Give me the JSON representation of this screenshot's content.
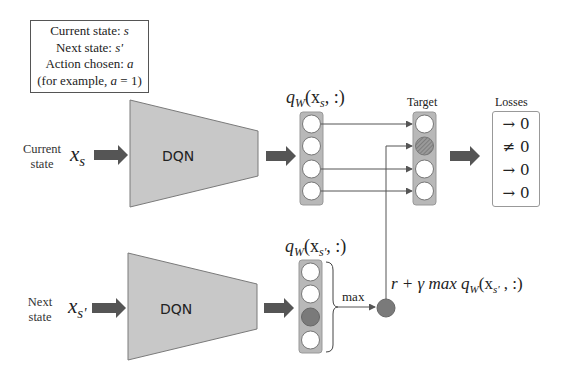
{
  "info_box": {
    "line1_label": "Current state: ",
    "line1_var": "s",
    "line2_label": "Next state: ",
    "line2_var": "s'",
    "line3_label": "Action chosen: ",
    "line3_var": "a",
    "line4_prefix": "(for example, ",
    "line4_var": "a",
    "line4_suffix": " = 1)"
  },
  "top_branch": {
    "side_label_line1": "Current",
    "side_label_line2": "state",
    "input_symbol": "x",
    "input_subscript": "s",
    "network_label": "DQN",
    "output_label": "q",
    "output_label_sub": "W",
    "output_label_args": "(x",
    "output_label_args_sub": "s",
    "output_label_tail": ", :)",
    "num_outputs": 4
  },
  "bottom_branch": {
    "side_label_line1": "Next",
    "side_label_line2": "state",
    "input_symbol": "x",
    "input_subscript": "s'",
    "network_label": "DQN",
    "output_label": "q",
    "output_label_sub": "W",
    "output_label_args": "(x",
    "output_label_args_sub": "s'",
    "output_label_tail": ", :)",
    "max_node_index": 2,
    "max_label": "max"
  },
  "target": {
    "label": "Target",
    "replaced_index": 1,
    "formula_prefix": "r + γ max q",
    "formula_sub": "W",
    "formula_args": "(x",
    "formula_args_sub": "s'",
    "formula_tail": " , :)"
  },
  "losses": {
    "label": "Losses",
    "items": [
      "→ 0",
      "≠ 0",
      "→ 0",
      "→ 0"
    ]
  },
  "colors": {
    "network_fill": "#c8c8c8",
    "network_stroke": "#7a7a7a",
    "column_fill": "#b8b8b8",
    "arrow_fill": "#555555",
    "max_node_fill": "#7a7a7a",
    "hatched_node": "#8a8a8a",
    "line_color": "#555555"
  }
}
